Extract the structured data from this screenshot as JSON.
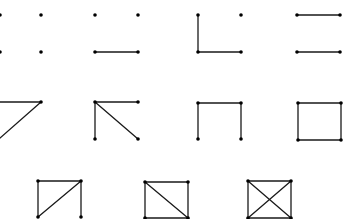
{
  "diagram": {
    "type": "graph-sequence",
    "colors": {
      "edge": "#1a1a1a",
      "vertex": "#000000",
      "background": "#ffffff"
    },
    "graphs": [
      {
        "id": "g1",
        "edge_count": 0,
        "vertices": [
          [
            0,
            15
          ],
          [
            41,
            15
          ],
          [
            0,
            52
          ],
          [
            41,
            52
          ]
        ],
        "edges": []
      },
      {
        "id": "g2",
        "edge_count": 1,
        "vertices": [
          [
            95,
            15
          ],
          [
            138,
            15
          ],
          [
            95,
            52
          ],
          [
            138,
            52
          ]
        ],
        "edges": [
          [
            [
              95,
              52
            ],
            [
              138,
              52
            ]
          ]
        ]
      },
      {
        "id": "g3",
        "edge_count": 2,
        "vertices": [
          [
            198,
            15
          ],
          [
            241,
            15
          ],
          [
            198,
            52
          ],
          [
            241,
            52
          ]
        ],
        "edges": [
          [
            [
              198,
              15
            ],
            [
              198,
              52
            ]
          ],
          [
            [
              198,
              52
            ],
            [
              241,
              52
            ]
          ]
        ]
      },
      {
        "id": "g4",
        "edge_count": 2,
        "vertices": [
          [
            297,
            15
          ],
          [
            340,
            15
          ],
          [
            297,
            52
          ],
          [
            340,
            52
          ]
        ],
        "edges": [
          [
            [
              297,
              15
            ],
            [
              340,
              15
            ]
          ],
          [
            [
              297,
              52
            ],
            [
              340,
              52
            ]
          ]
        ]
      },
      {
        "id": "g5",
        "edge_count": 2,
        "vertices": [
          [
            41,
            102
          ]
        ],
        "edges": [
          [
            [
              0,
              102
            ],
            [
              41,
              102
            ]
          ],
          [
            [
              41,
              102
            ],
            [
              0,
              138
            ]
          ]
        ]
      },
      {
        "id": "g6",
        "edge_count": 3,
        "vertices": [
          [
            95,
            102
          ],
          [
            138,
            102
          ],
          [
            95,
            139
          ],
          [
            138,
            139
          ]
        ],
        "edges": [
          [
            [
              95,
              102
            ],
            [
              138,
              102
            ]
          ],
          [
            [
              95,
              102
            ],
            [
              95,
              139
            ]
          ],
          [
            [
              95,
              102
            ],
            [
              138,
              139
            ]
          ]
        ]
      },
      {
        "id": "g7",
        "edge_count": 3,
        "vertices": [
          [
            198,
            103
          ],
          [
            241,
            103
          ],
          [
            198,
            139
          ],
          [
            241,
            139
          ]
        ],
        "edges": [
          [
            [
              198,
              103
            ],
            [
              241,
              103
            ]
          ],
          [
            [
              198,
              103
            ],
            [
              198,
              139
            ]
          ],
          [
            [
              241,
              103
            ],
            [
              241,
              139
            ]
          ]
        ]
      },
      {
        "id": "g8",
        "edge_count": 4,
        "vertices": [
          [
            298,
            103
          ],
          [
            341,
            103
          ],
          [
            298,
            140
          ],
          [
            341,
            140
          ]
        ],
        "edges": [
          [
            [
              298,
              103
            ],
            [
              341,
              103
            ]
          ],
          [
            [
              298,
              103
            ],
            [
              298,
              140
            ]
          ],
          [
            [
              341,
              103
            ],
            [
              341,
              140
            ]
          ],
          [
            [
              298,
              140
            ],
            [
              341,
              140
            ]
          ]
        ]
      },
      {
        "id": "g9",
        "edge_count": 4,
        "vertices": [
          [
            38,
            181
          ],
          [
            81,
            181
          ],
          [
            38,
            217
          ],
          [
            81,
            217
          ]
        ],
        "edges": [
          [
            [
              38,
              181
            ],
            [
              81,
              181
            ]
          ],
          [
            [
              38,
              181
            ],
            [
              38,
              217
            ]
          ],
          [
            [
              81,
              181
            ],
            [
              81,
              217
            ]
          ],
          [
            [
              81,
              181
            ],
            [
              38,
              217
            ]
          ]
        ]
      },
      {
        "id": "g10",
        "edge_count": 5,
        "vertices": [
          [
            145,
            182
          ],
          [
            188,
            182
          ],
          [
            145,
            218
          ],
          [
            188,
            218
          ]
        ],
        "edges": [
          [
            [
              145,
              182
            ],
            [
              188,
              182
            ]
          ],
          [
            [
              145,
              182
            ],
            [
              145,
              218
            ]
          ],
          [
            [
              188,
              182
            ],
            [
              188,
              218
            ]
          ],
          [
            [
              145,
              182
            ],
            [
              188,
              218
            ]
          ],
          [
            [
              145,
              218
            ],
            [
              188,
              218
            ]
          ]
        ]
      },
      {
        "id": "g11",
        "edge_count": 6,
        "vertices": [
          [
            248,
            181
          ],
          [
            291,
            181
          ],
          [
            248,
            218
          ],
          [
            291,
            218
          ]
        ],
        "edges": [
          [
            [
              248,
              181
            ],
            [
              291,
              181
            ]
          ],
          [
            [
              248,
              181
            ],
            [
              248,
              218
            ]
          ],
          [
            [
              291,
              181
            ],
            [
              291,
              218
            ]
          ],
          [
            [
              248,
              218
            ],
            [
              291,
              218
            ]
          ],
          [
            [
              248,
              181
            ],
            [
              291,
              218
            ]
          ],
          [
            [
              291,
              181
            ],
            [
              248,
              218
            ]
          ]
        ]
      }
    ]
  }
}
